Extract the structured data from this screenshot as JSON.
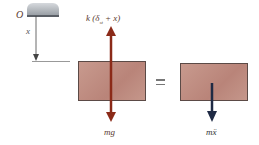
{
  "figure": {
    "origin_label": "O",
    "position_label": "x",
    "spring_force_label": "k (δ",
    "spring_force_sub": "st",
    "spring_force_tail": " + x)",
    "weight_label": "mg",
    "equals_sign": "=",
    "inertia_label": "mẍ",
    "colors": {
      "force_arrow": "#8b2a18",
      "inertia_arrow": "#1f2a44",
      "block_fill": "#bf8d82",
      "support": "#a8adb3"
    }
  }
}
